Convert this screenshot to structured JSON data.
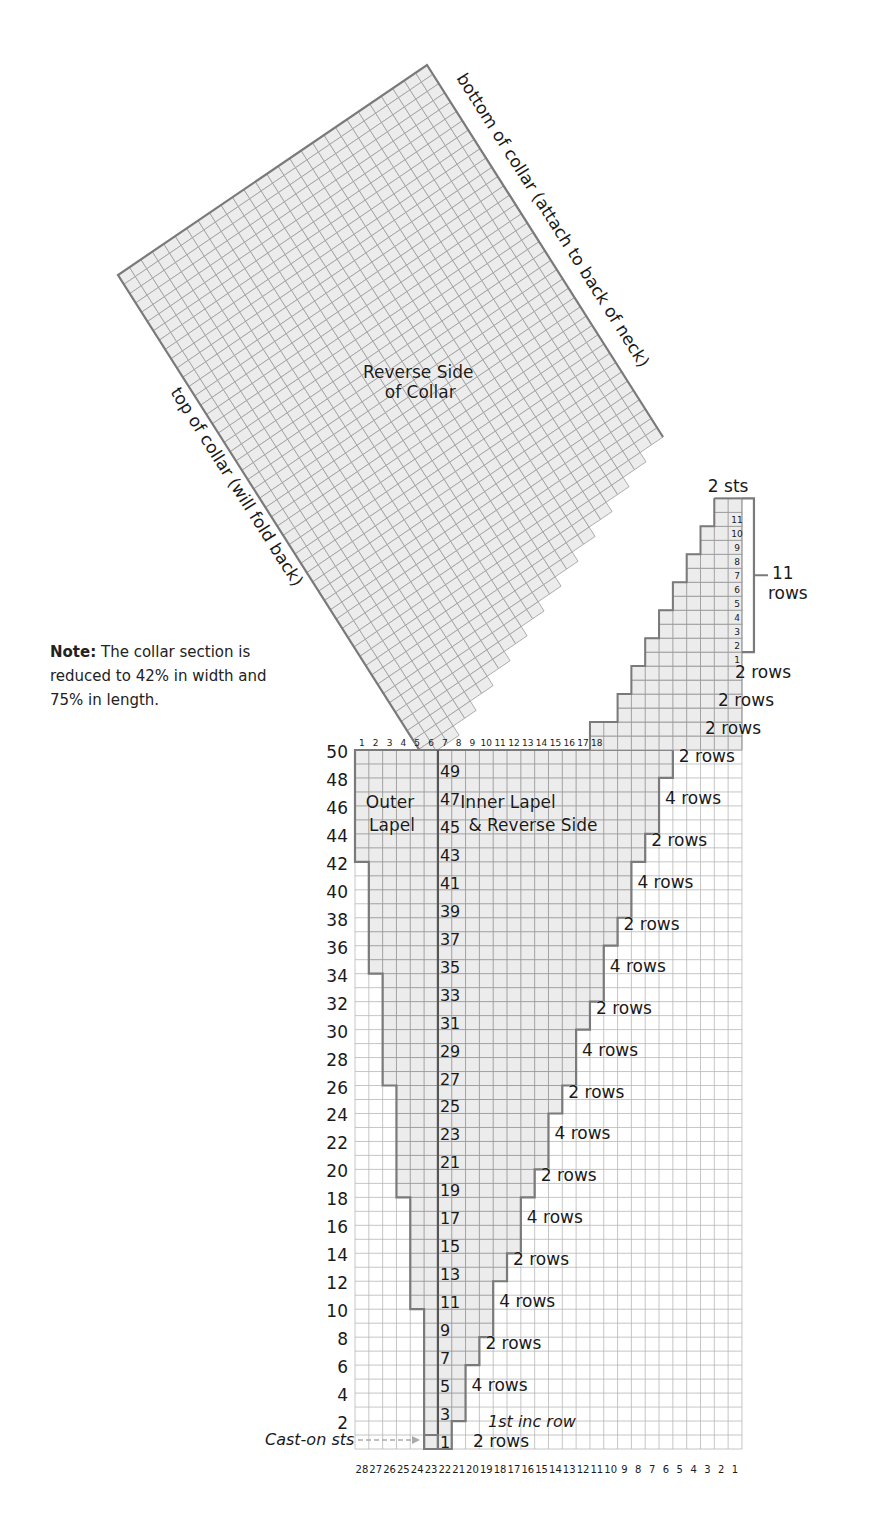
{
  "note": {
    "bold": "Note:",
    "text": " The collar section is reduced to 42% in width and 75% in length."
  },
  "collar": {
    "center_label_line1": "Reverse Side",
    "center_label_line2": "of Collar",
    "edge_label_right": "bottom of collar (attach to back of neck)",
    "edge_label_left": "top of collar (will fold back)"
  },
  "top_section": {
    "width_label": "2 sts",
    "rows_label_num": "11",
    "rows_label_text": "rows",
    "row_numbers": [
      "1",
      "2",
      "3",
      "4",
      "5",
      "6",
      "7",
      "8",
      "9",
      "10",
      "11"
    ]
  },
  "lapel": {
    "outer_label_line1": "Outer",
    "outer_label_line2": "Lapel",
    "inner_label_line1": "Inner Lapel",
    "inner_label_line2": "& Reverse Side",
    "cast_on_label": "Cast-on sts",
    "first_inc_label": "1st inc row",
    "odd_row_numbers": [
      "1",
      "3",
      "5",
      "7",
      "9",
      "11",
      "13",
      "15",
      "17",
      "19",
      "21",
      "23",
      "25",
      "27",
      "29",
      "31",
      "33",
      "35",
      "37",
      "39",
      "41",
      "43",
      "45",
      "47",
      "49"
    ],
    "left_row_numbers": [
      "2",
      "4",
      "6",
      "8",
      "10",
      "12",
      "14",
      "16",
      "18",
      "20",
      "22",
      "24",
      "26",
      "28",
      "30",
      "32",
      "34",
      "36",
      "38",
      "40",
      "42",
      "44",
      "46",
      "48",
      "50"
    ],
    "top_col_numbers": [
      "1",
      "2",
      "3",
      "4",
      "5",
      "6",
      "7",
      "8",
      "9",
      "10",
      "11",
      "12",
      "13",
      "14",
      "15",
      "16",
      "17",
      "18"
    ],
    "bottom_col_numbers": [
      "28",
      "27",
      "26",
      "25",
      "24",
      "23",
      "22",
      "21",
      "20",
      "19",
      "18",
      "17",
      "16",
      "15",
      "14",
      "13",
      "12",
      "11",
      "10",
      "9",
      "8",
      "7",
      "6",
      "5",
      "4",
      "3",
      "2",
      "1"
    ]
  },
  "step_labels": [
    {
      "text": "2 rows",
      "row": 1
    },
    {
      "text": "4 rows",
      "row": 5
    },
    {
      "text": "2 rows",
      "row": 8
    },
    {
      "text": "4 rows",
      "row": 11
    },
    {
      "text": "2 rows",
      "row": 14
    },
    {
      "text": "4 rows",
      "row": 17
    },
    {
      "text": "2 rows",
      "row": 20
    },
    {
      "text": "4 rows",
      "row": 23
    },
    {
      "text": "2 rows",
      "row": 26
    },
    {
      "text": "4 rows",
      "row": 29
    },
    {
      "text": "2 rows",
      "row": 32
    },
    {
      "text": "4 rows",
      "row": 35
    },
    {
      "text": "2 rows",
      "row": 38
    },
    {
      "text": "4 rows",
      "row": 41
    },
    {
      "text": "2 rows",
      "row": 44
    },
    {
      "text": "4 rows",
      "row": 47
    },
    {
      "text": "2 rows",
      "row": 50
    },
    {
      "text": "2 rows",
      "row": 52
    },
    {
      "text": "2 rows",
      "row": 54
    },
    {
      "text": "2 rows",
      "row": 56
    }
  ],
  "colors": {
    "fill": "#ececec",
    "grid": "#9a9a9a",
    "outline": "#7a7a7a",
    "text": "#1a1a1a"
  }
}
